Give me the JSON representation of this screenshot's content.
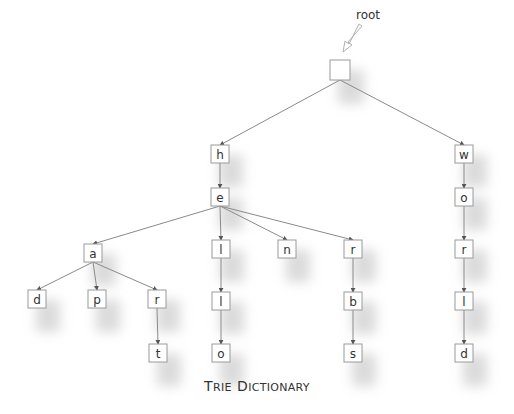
{
  "diagram": {
    "title": "Trie Dictionary",
    "title_parts": {
      "T": "T",
      "RIE": "RIE",
      "D": "D",
      "ICTIONARY": "ICTIONARY"
    },
    "root_label": "root",
    "colors": {
      "box_stroke": "#9a9a9a",
      "edge": "#8a8a8a",
      "text": "#333333",
      "shadow": "#bdbdbd"
    },
    "box_size": 18,
    "nodes": [
      {
        "id": "root",
        "label": "",
        "x": 340,
        "y": 70,
        "size": 20
      },
      {
        "id": "h",
        "label": "h",
        "x": 220,
        "y": 154
      },
      {
        "id": "e",
        "label": "e",
        "x": 220,
        "y": 197
      },
      {
        "id": "a",
        "label": "a",
        "x": 93,
        "y": 253
      },
      {
        "id": "l1",
        "label": "l",
        "x": 221,
        "y": 249
      },
      {
        "id": "n",
        "label": "n",
        "x": 287,
        "y": 249
      },
      {
        "id": "r1",
        "label": "r",
        "x": 353,
        "y": 249
      },
      {
        "id": "d1",
        "label": "d",
        "x": 37,
        "y": 299
      },
      {
        "id": "p",
        "label": "p",
        "x": 97,
        "y": 299
      },
      {
        "id": "r2",
        "label": "r",
        "x": 157,
        "y": 299
      },
      {
        "id": "t",
        "label": "t",
        "x": 158,
        "y": 353
      },
      {
        "id": "l2",
        "label": "l",
        "x": 221,
        "y": 301
      },
      {
        "id": "o1",
        "label": "o",
        "x": 221,
        "y": 353
      },
      {
        "id": "b",
        "label": "b",
        "x": 353,
        "y": 301
      },
      {
        "id": "s",
        "label": "s",
        "x": 353,
        "y": 353
      },
      {
        "id": "w",
        "label": "w",
        "x": 464,
        "y": 154
      },
      {
        "id": "o2",
        "label": "o",
        "x": 464,
        "y": 197
      },
      {
        "id": "r3",
        "label": "r",
        "x": 464,
        "y": 249
      },
      {
        "id": "l3",
        "label": "l",
        "x": 464,
        "y": 301
      },
      {
        "id": "d2",
        "label": "d",
        "x": 464,
        "y": 353
      }
    ],
    "edges": [
      [
        "root",
        "h"
      ],
      [
        "root",
        "w"
      ],
      [
        "h",
        "e"
      ],
      [
        "e",
        "a"
      ],
      [
        "e",
        "l1"
      ],
      [
        "e",
        "n"
      ],
      [
        "e",
        "r1"
      ],
      [
        "a",
        "d1"
      ],
      [
        "a",
        "p"
      ],
      [
        "a",
        "r2"
      ],
      [
        "r2",
        "t"
      ],
      [
        "l1",
        "l2"
      ],
      [
        "l2",
        "o1"
      ],
      [
        "r1",
        "b"
      ],
      [
        "b",
        "s"
      ],
      [
        "w",
        "o2"
      ],
      [
        "o2",
        "r3"
      ],
      [
        "r3",
        "l3"
      ],
      [
        "l3",
        "d2"
      ]
    ],
    "words": [
      "ad",
      "ap",
      "art",
      "hello",
      "hen",
      "herbs",
      "world"
    ]
  }
}
